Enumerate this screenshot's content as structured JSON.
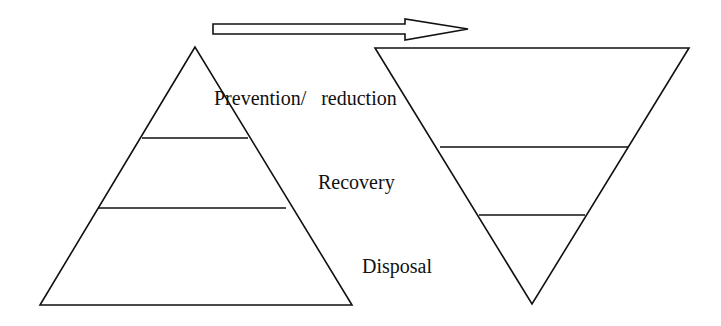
{
  "diagram": {
    "type": "waste-hierarchy-inversion",
    "colors": {
      "stroke": "#111111",
      "background": "#ffffff"
    },
    "arrow": {
      "direction": "right",
      "meaning": "shift from current pyramid to desired inverted pyramid"
    },
    "left_pyramid": {
      "orientation": "upright",
      "tiers": 3
    },
    "right_pyramid": {
      "orientation": "inverted",
      "tiers": 3
    },
    "labels": {
      "prevention": "Prevention/   reduction",
      "recovery": "Recovery",
      "disposal": "Disposal"
    }
  }
}
